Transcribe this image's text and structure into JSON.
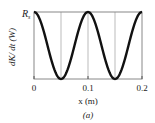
{
  "chart_data": {
    "type": "line",
    "title": "",
    "xlabel": "x (m)",
    "ylabel": "dK/ dt (W)",
    "caption": "(a)",
    "x_ticks": [
      "0",
      "0.1",
      "0.2"
    ],
    "y_ticks": [
      "R_s"
    ],
    "y_tick_label_main": "R",
    "y_tick_label_sub": "s",
    "xlim": [
      0,
      0.2
    ],
    "ylim": [
      0,
      1
    ],
    "grid": true,
    "grid_x": [
      0.05,
      0.1,
      0.15
    ],
    "series": [
      {
        "name": "dK/dt",
        "x": [
          0,
          0.0125,
          0.025,
          0.0375,
          0.05,
          0.0625,
          0.075,
          0.0875,
          0.1,
          0.1125,
          0.125,
          0.1375,
          0.15,
          0.1625,
          0.175,
          0.1875,
          0.2
        ],
        "values": [
          1,
          0.854,
          0.5,
          0.146,
          0,
          0.146,
          0.5,
          0.854,
          1,
          0.854,
          0.5,
          0.146,
          0,
          0.146,
          0.5,
          0.854,
          1
        ]
      }
    ],
    "colors": {
      "curve": "#111111",
      "frame": "#888888",
      "grid": "#bbbbbb"
    }
  }
}
